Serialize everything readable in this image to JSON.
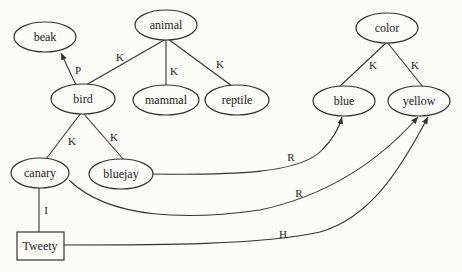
{
  "nodes": {
    "beak": {
      "label": "beak",
      "shape": "ellipse"
    },
    "animal": {
      "label": "animal",
      "shape": "ellipse"
    },
    "bird": {
      "label": "bird",
      "shape": "ellipse"
    },
    "mammal": {
      "label": "mammal",
      "shape": "ellipse"
    },
    "reptile": {
      "label": "reptile",
      "shape": "ellipse"
    },
    "color": {
      "label": "color",
      "shape": "ellipse"
    },
    "blue": {
      "label": "blue",
      "shape": "ellipse"
    },
    "yellow": {
      "label": "yellow",
      "shape": "ellipse"
    },
    "canary": {
      "label": "canary",
      "shape": "ellipse"
    },
    "bluejay": {
      "label": "bluejay",
      "shape": "ellipse"
    },
    "tweety": {
      "label": "Tweety",
      "shape": "rectangle"
    }
  },
  "edges": {
    "animal_bird": {
      "label": "K"
    },
    "animal_mammal": {
      "label": "K"
    },
    "animal_reptile": {
      "label": "K"
    },
    "bird_beak": {
      "label": "P"
    },
    "bird_canary": {
      "label": "K"
    },
    "bird_bluejay": {
      "label": "K"
    },
    "color_blue": {
      "label": "K"
    },
    "color_yellow": {
      "label": "K"
    },
    "canary_tweety": {
      "label": "I"
    },
    "bluejay_blue": {
      "label": "R"
    },
    "canary_yellow": {
      "label": "R"
    },
    "tweety_yellow": {
      "label": "H"
    }
  }
}
